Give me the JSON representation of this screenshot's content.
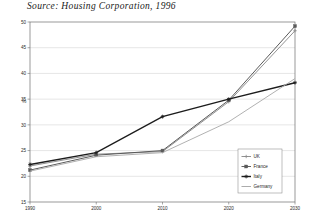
{
  "caption": "Source: Housing Corporation, 1996",
  "axis": {
    "y_unit": "%",
    "y_ticks": [
      "15",
      "20",
      "25",
      "30",
      "35",
      "40",
      "45",
      "50"
    ],
    "x_ticks": [
      "1990",
      "2000",
      "2010",
      "2020",
      "2030"
    ]
  },
  "legend": {
    "items": [
      {
        "label": "UK",
        "marker": "cross-marker",
        "color": "#8c8c8c"
      },
      {
        "label": "France",
        "marker": "square-marker",
        "color": "#5a5a5a"
      },
      {
        "label": "Italy",
        "marker": "star-marker",
        "color": "#1c1c1c"
      },
      {
        "label": "Germany",
        "marker": "line-marker",
        "color": "#a8a8a8"
      }
    ]
  },
  "chart_data": {
    "type": "line",
    "title": "",
    "subtitle": "",
    "xlabel": "",
    "ylabel": "%",
    "x": [
      1990,
      2000,
      2010,
      2020,
      2030
    ],
    "xlim": [
      1990,
      2030
    ],
    "ylim": [
      15,
      50
    ],
    "grid": true,
    "legend_position": "bottom-right",
    "annotations": [
      "Source: Housing Corporation, 1996"
    ],
    "series": [
      {
        "name": "UK",
        "values": [
          22.0,
          24.3,
          24.8,
          34.5,
          48.3
        ]
      },
      {
        "name": "France",
        "values": [
          21.2,
          24.1,
          25.0,
          34.8,
          49.2
        ]
      },
      {
        "name": "Italy",
        "values": [
          22.3,
          24.6,
          31.6,
          35.0,
          38.2
        ]
      },
      {
        "name": "Germany",
        "values": [
          21.0,
          23.8,
          24.6,
          30.6,
          39.0
        ]
      }
    ]
  }
}
